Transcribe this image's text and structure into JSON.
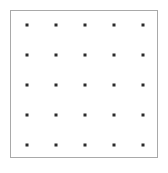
{
  "figure": {
    "title": "",
    "width": 168,
    "height": 173,
    "background_color": "#ffffff"
  },
  "frame": {
    "name": "plot-border",
    "x": 10,
    "y": 10,
    "width": 148,
    "height": 148,
    "border_color": "#a9a9a9",
    "border_width": 1,
    "fill_color": "#ffffff"
  },
  "chart_data": {
    "type": "scatter",
    "title": "",
    "xlabel": "",
    "ylabel": "",
    "grid": false,
    "legend": null,
    "marker": {
      "shape": "square",
      "size_px": 3,
      "color": "#2b2b2b"
    },
    "rows": 5,
    "columns": 5,
    "point_count": 25,
    "x_positions_px": [
      27,
      56,
      85,
      114,
      143
    ],
    "y_positions_px": [
      25,
      55,
      85,
      115,
      145
    ],
    "x_spacing_px": 29,
    "y_spacing_px": 30,
    "x": [
      27,
      56,
      85,
      114,
      143,
      27,
      56,
      85,
      114,
      143,
      27,
      56,
      85,
      114,
      143,
      27,
      56,
      85,
      114,
      143,
      27,
      56,
      85,
      114,
      143
    ],
    "y": [
      25,
      25,
      25,
      25,
      25,
      55,
      55,
      55,
      55,
      55,
      85,
      85,
      85,
      85,
      85,
      115,
      115,
      115,
      115,
      115,
      145,
      145,
      145,
      145,
      145
    ],
    "points": [
      {
        "col": 1,
        "row": 1,
        "x": 27,
        "y": 25
      },
      {
        "col": 2,
        "row": 1,
        "x": 56,
        "y": 25
      },
      {
        "col": 3,
        "row": 1,
        "x": 85,
        "y": 25
      },
      {
        "col": 4,
        "row": 1,
        "x": 114,
        "y": 25
      },
      {
        "col": 5,
        "row": 1,
        "x": 143,
        "y": 25
      },
      {
        "col": 1,
        "row": 2,
        "x": 27,
        "y": 55
      },
      {
        "col": 2,
        "row": 2,
        "x": 56,
        "y": 55
      },
      {
        "col": 3,
        "row": 2,
        "x": 85,
        "y": 55
      },
      {
        "col": 4,
        "row": 2,
        "x": 114,
        "y": 55
      },
      {
        "col": 5,
        "row": 2,
        "x": 143,
        "y": 55
      },
      {
        "col": 1,
        "row": 3,
        "x": 27,
        "y": 85
      },
      {
        "col": 2,
        "row": 3,
        "x": 56,
        "y": 85
      },
      {
        "col": 3,
        "row": 3,
        "x": 85,
        "y": 85
      },
      {
        "col": 4,
        "row": 3,
        "x": 114,
        "y": 85
      },
      {
        "col": 5,
        "row": 3,
        "x": 143,
        "y": 85
      },
      {
        "col": 1,
        "row": 4,
        "x": 27,
        "y": 115
      },
      {
        "col": 2,
        "row": 4,
        "x": 56,
        "y": 115
      },
      {
        "col": 3,
        "row": 4,
        "x": 85,
        "y": 115
      },
      {
        "col": 4,
        "row": 4,
        "x": 114,
        "y": 115
      },
      {
        "col": 5,
        "row": 4,
        "x": 143,
        "y": 115
      },
      {
        "col": 1,
        "row": 5,
        "x": 27,
        "y": 145
      },
      {
        "col": 2,
        "row": 5,
        "x": 56,
        "y": 145
      },
      {
        "col": 3,
        "row": 5,
        "x": 85,
        "y": 145
      },
      {
        "col": 4,
        "row": 5,
        "x": 114,
        "y": 145
      },
      {
        "col": 5,
        "row": 5,
        "x": 143,
        "y": 145
      }
    ]
  }
}
